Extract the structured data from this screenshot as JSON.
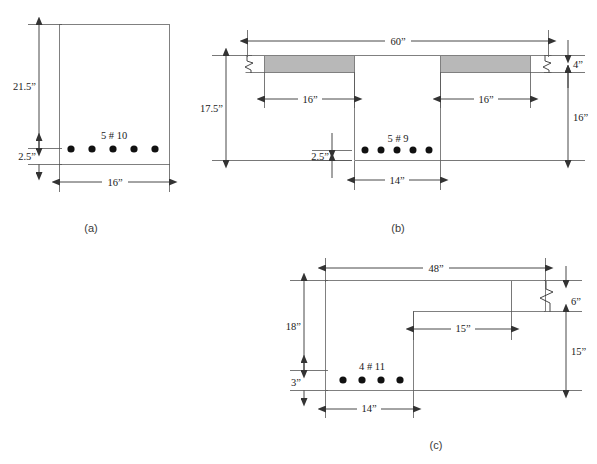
{
  "figure": {
    "background_color": "#ffffff",
    "outline_color": "#808080",
    "dimension_color": "#333333",
    "rebar_color": "#111111",
    "flange_shade_color": "#b8b8b8"
  },
  "parts": [
    {
      "id": "a",
      "caption": "(a)",
      "section_type": "rectangular",
      "reinforcement_label": "5 # 10",
      "bar_count": 5,
      "bar_size": "#10",
      "dimensions": [
        {
          "name": "effective-depth",
          "label": "21.5”",
          "value": 21.5,
          "unit": "in",
          "orientation": "vertical"
        },
        {
          "name": "cover-depth",
          "label": "2.5”",
          "value": 2.5,
          "unit": "in",
          "orientation": "vertical"
        },
        {
          "name": "width",
          "label": "16”",
          "value": 16,
          "unit": "in",
          "orientation": "horizontal"
        }
      ]
    },
    {
      "id": "b",
      "caption": "(b)",
      "section_type": "t-beam",
      "reinforcement_label": "5 # 9",
      "bar_count": 5,
      "bar_size": "#9",
      "dimensions": [
        {
          "name": "flange-width",
          "label": "60”",
          "value": 60,
          "unit": "in",
          "orientation": "horizontal"
        },
        {
          "name": "flange-overhang-left",
          "label": "16”",
          "value": 16,
          "unit": "in",
          "orientation": "horizontal"
        },
        {
          "name": "flange-overhang-right",
          "label": "16”",
          "value": 16,
          "unit": "in",
          "orientation": "horizontal"
        },
        {
          "name": "effective-depth",
          "label": "17.5”",
          "value": 17.5,
          "unit": "in",
          "orientation": "vertical"
        },
        {
          "name": "cover-depth",
          "label": "2.5”",
          "value": 2.5,
          "unit": "in",
          "orientation": "vertical"
        },
        {
          "name": "web-width",
          "label": "14”",
          "value": 14,
          "unit": "in",
          "orientation": "horizontal"
        },
        {
          "name": "flange-thickness",
          "label": "4”",
          "value": 4,
          "unit": "in",
          "orientation": "vertical"
        },
        {
          "name": "web-depth",
          "label": "16”",
          "value": 16,
          "unit": "in",
          "orientation": "vertical"
        }
      ]
    },
    {
      "id": "c",
      "caption": "(c)",
      "section_type": "l-beam",
      "reinforcement_label": "4 # 11",
      "bar_count": 4,
      "bar_size": "#11",
      "dimensions": [
        {
          "name": "flange-width",
          "label": "48”",
          "value": 48,
          "unit": "in",
          "orientation": "horizontal"
        },
        {
          "name": "effective-depth",
          "label": "18”",
          "value": 18,
          "unit": "in",
          "orientation": "vertical"
        },
        {
          "name": "cover-depth",
          "label": "3”",
          "value": 3,
          "unit": "in",
          "orientation": "vertical"
        },
        {
          "name": "web-width",
          "label": "14”",
          "value": 14,
          "unit": "in",
          "orientation": "horizontal"
        },
        {
          "name": "flange-overhang",
          "label": "15”",
          "value": 15,
          "unit": "in",
          "orientation": "horizontal"
        },
        {
          "name": "flange-thickness",
          "label": "6”",
          "value": 6,
          "unit": "in",
          "orientation": "vertical"
        },
        {
          "name": "web-depth",
          "label": "15”",
          "value": 15,
          "unit": "in",
          "orientation": "vertical"
        }
      ]
    }
  ],
  "labels": {
    "a_caption": "(a)",
    "a_bars": "5 # 10",
    "a_depth": "21.5”",
    "a_cover": "2.5”",
    "a_width": "16”",
    "b_caption": "(b)",
    "b_bars": "5 # 9",
    "b_flange_width": "60”",
    "b_overhang_left": "16”",
    "b_overhang_right": "16”",
    "b_depth": "17.5”",
    "b_cover": "2.5”",
    "b_web_width": "14”",
    "b_flange_thickness": "4”",
    "b_web_depth": "16”",
    "c_caption": "(c)",
    "c_bars": "4 # 11",
    "c_flange_width": "48”",
    "c_depth": "18”",
    "c_cover": "3”",
    "c_web_width": "14”",
    "c_overhang": "15”",
    "c_flange_thickness": "6”",
    "c_web_depth": "15”"
  }
}
